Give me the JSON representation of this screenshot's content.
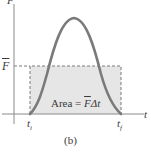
{
  "figure": {
    "caption": "(b)",
    "axes": {
      "y_label": "F",
      "x_label": "t"
    },
    "average_force_label": "F",
    "ticks": {
      "start": "t",
      "start_sub": "i",
      "end": "t",
      "end_sub": "f"
    },
    "area_label": {
      "prefix": "Area = ",
      "symbol": "F",
      "suffix": "Δt"
    },
    "colors": {
      "curve": "#7a7a7a",
      "axes": "#8a8a8a",
      "rect_fill": "#e6e6e6",
      "rect_border": "#7a7a7a",
      "text": "#3a3a3a"
    }
  }
}
